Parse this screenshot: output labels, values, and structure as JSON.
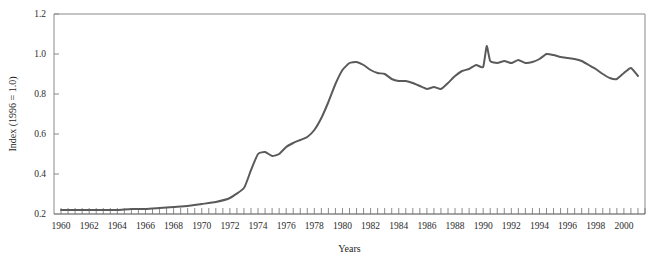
{
  "figure": {
    "caption_fragment": "",
    "background_color": "#ffffff"
  },
  "chart_data": {
    "type": "line",
    "title": "",
    "subtitle": "",
    "xlabel": "Years",
    "ylabel": "Index (1996 = 1.0)",
    "xlim": [
      1959.5,
      2001.5
    ],
    "ylim": [
      0.2,
      1.2
    ],
    "grid": false,
    "legend": null,
    "legend_position": "none",
    "series_color": "#5a5a5a",
    "series_width": 2.0,
    "axis_color": "#8a8a8a",
    "y_ticks": [
      0.2,
      0.4,
      0.6,
      0.8,
      1.0,
      1.2
    ],
    "y_tick_labels": [
      "0.2",
      "0.4",
      "0.6",
      "0.8",
      "1.0",
      "1.2"
    ],
    "x_ticks": [
      1960,
      1962,
      1964,
      1966,
      1968,
      1970,
      1972,
      1974,
      1976,
      1978,
      1980,
      1982,
      1984,
      1986,
      1988,
      1990,
      1992,
      1994,
      1996,
      1998,
      2000
    ],
    "x_tick_labels": [
      "1960",
      "1962",
      "1964",
      "1966",
      "1968",
      "1970",
      "1972",
      "1974",
      "1976",
      "1978",
      "1980",
      "1982",
      "1984",
      "1986",
      "1988",
      "1990",
      "1992",
      "1994",
      "1996",
      "1998",
      "2000"
    ],
    "x_minor_tick_step": 0.5,
    "series": [
      {
        "name": "Index (1996 = 1.0)",
        "x": [
          1960,
          1961,
          1962,
          1963,
          1964,
          1965,
          1966,
          1967,
          1968,
          1969,
          1970,
          1971,
          1972,
          1973,
          1973.5,
          1974,
          1974.5,
          1975,
          1975.5,
          1976,
          1976.5,
          1977,
          1977.5,
          1978,
          1978.5,
          1979,
          1979.5,
          1980,
          1980.5,
          1981,
          1981.5,
          1982,
          1982.5,
          1983,
          1983.5,
          1984,
          1984.5,
          1985,
          1985.5,
          1986,
          1986.5,
          1987,
          1987.5,
          1988,
          1988.5,
          1989,
          1989.5,
          1990,
          1990.25,
          1990.5,
          1991,
          1991.5,
          1992,
          1992.5,
          1993,
          1993.5,
          1994,
          1994.5,
          1995,
          1995.5,
          1996,
          1996.5,
          1997,
          1997.5,
          1998,
          1998.5,
          1999,
          1999.5,
          2000,
          2000.5,
          2001
        ],
        "values": [
          0.22,
          0.22,
          0.22,
          0.22,
          0.22,
          0.225,
          0.225,
          0.23,
          0.235,
          0.24,
          0.25,
          0.26,
          0.28,
          0.33,
          0.42,
          0.5,
          0.51,
          0.49,
          0.5,
          0.535,
          0.555,
          0.57,
          0.585,
          0.62,
          0.68,
          0.76,
          0.85,
          0.92,
          0.955,
          0.96,
          0.945,
          0.92,
          0.905,
          0.9,
          0.875,
          0.865,
          0.865,
          0.855,
          0.84,
          0.825,
          0.835,
          0.825,
          0.855,
          0.89,
          0.915,
          0.925,
          0.945,
          0.935,
          1.04,
          0.965,
          0.955,
          0.965,
          0.955,
          0.97,
          0.955,
          0.96,
          0.975,
          1.0,
          0.995,
          0.985,
          0.98,
          0.975,
          0.965,
          0.945,
          0.925,
          0.9,
          0.88,
          0.875,
          0.905,
          0.93,
          0.89
        ]
      }
    ]
  }
}
